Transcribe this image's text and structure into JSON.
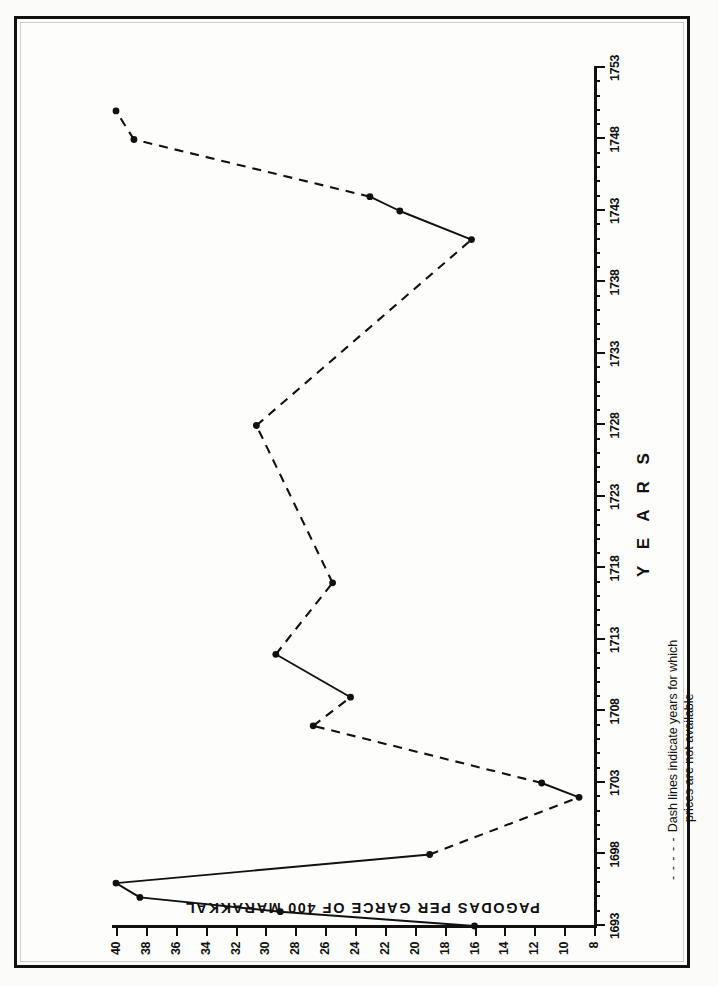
{
  "figure": {
    "x_axis_title": "Y E A R S",
    "y_axis_title": "PAGODAS  PER  GARCE  OF  400  MARAKKAL",
    "legend_dash_key": "- - - - -",
    "legend_line1": "Dash lines indicate years for which",
    "legend_line2": "prices are not available",
    "ink_color": "#111111",
    "paper_color": "#fdfdfc"
  },
  "chart_data": {
    "type": "line",
    "title": "",
    "xlabel": "Y E A R S",
    "ylabel": "PAGODAS PER GARCE OF 400 MARAKKAL",
    "xlim": [
      1693,
      1753
    ],
    "ylim": [
      8,
      40
    ],
    "grid": false,
    "legend_position": "below-axis",
    "x_tick_labels": [
      "1693",
      "1698",
      "1703",
      "1708",
      "1713",
      "1718",
      "1723",
      "1728",
      "1733",
      "1738",
      "1743",
      "1748",
      "1753"
    ],
    "x_tick_values": [
      1693,
      1698,
      1703,
      1708,
      1713,
      1718,
      1723,
      1728,
      1733,
      1738,
      1743,
      1748,
      1753
    ],
    "x_minor_tick_step": 1,
    "y_tick_labels": [
      "8",
      "10",
      "12",
      "14",
      "16",
      "18",
      "20",
      "22",
      "24",
      "26",
      "28",
      "30",
      "32",
      "34",
      "36",
      "38",
      "40"
    ],
    "y_tick_values": [
      8,
      10,
      12,
      14,
      16,
      18,
      20,
      22,
      24,
      26,
      28,
      30,
      32,
      34,
      36,
      38,
      40
    ],
    "series": [
      {
        "name": "Price of paddy",
        "style": "mixed-solid-dashed",
        "note": "Solid segments join years with recorded prices; dashed segments bridge years with no data.",
        "points": [
          {
            "x": 1693,
            "y": 16.0,
            "marker": true,
            "segment_to_next": "solid"
          },
          {
            "x": 1694,
            "y": 29.0,
            "marker": true,
            "segment_to_next": "solid"
          },
          {
            "x": 1695,
            "y": 38.4,
            "marker": true,
            "segment_to_next": "solid"
          },
          {
            "x": 1696,
            "y": 40.0,
            "marker": true,
            "segment_to_next": "solid"
          },
          {
            "x": 1698,
            "y": 19.0,
            "marker": true,
            "segment_to_next": "dashed"
          },
          {
            "x": 1702,
            "y": 9.0,
            "marker": true,
            "segment_to_next": "solid"
          },
          {
            "x": 1703,
            "y": 11.5,
            "marker": true,
            "segment_to_next": "dashed"
          },
          {
            "x": 1707,
            "y": 26.8,
            "marker": true,
            "segment_to_next": "dashed"
          },
          {
            "x": 1709,
            "y": 24.3,
            "marker": true,
            "segment_to_next": "solid"
          },
          {
            "x": 1712,
            "y": 29.3,
            "marker": true,
            "segment_to_next": "dashed"
          },
          {
            "x": 1717,
            "y": 25.5,
            "marker": true,
            "segment_to_next": "dashed"
          },
          {
            "x": 1728,
            "y": 30.6,
            "marker": true,
            "segment_to_next": "dashed"
          },
          {
            "x": 1741,
            "y": 16.2,
            "marker": true,
            "segment_to_next": "solid"
          },
          {
            "x": 1743,
            "y": 21.0,
            "marker": true,
            "segment_to_next": "solid"
          },
          {
            "x": 1744,
            "y": 23.0,
            "marker": true,
            "segment_to_next": "dashed"
          },
          {
            "x": 1748,
            "y": 38.8,
            "marker": true,
            "segment_to_next": "dashed"
          },
          {
            "x": 1750,
            "y": 40.0,
            "marker": true,
            "segment_to_next": "none"
          }
        ]
      }
    ]
  }
}
